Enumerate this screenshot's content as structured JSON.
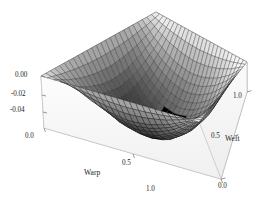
{
  "figure": {
    "kind": "surface-plot-3d",
    "background": "#ffffff",
    "frame_color": "#8a8a8a",
    "mesh_color": "#1a1a1a",
    "skirt_color": "#f2f2f2"
  },
  "axes": {
    "x": {
      "title": "Warp",
      "tick_labels": [
        "0.0",
        "0.5",
        "1.0"
      ],
      "tick_values": [
        0.0,
        0.5,
        1.0
      ],
      "range": [
        0.0,
        1.0
      ]
    },
    "y": {
      "title": "Weft",
      "tick_labels": [
        "0.0",
        "0.5",
        "1.0"
      ],
      "tick_values": [
        0.0,
        0.5,
        1.0
      ],
      "range": [
        0.0,
        1.0
      ]
    },
    "z": {
      "title": "",
      "tick_labels": [
        "0.00",
        "-0.02",
        "-0.04"
      ],
      "tick_values": [
        0.0,
        -0.02,
        -0.04
      ],
      "range": [
        -0.048,
        0.002
      ]
    }
  },
  "chart_data": {
    "type": "surface",
    "title": "",
    "xlabel": "Warp",
    "ylabel": "Weft",
    "zlabel": "",
    "xlim": [
      0.0,
      1.0
    ],
    "ylim": [
      0.0,
      1.0
    ],
    "zlim": [
      -0.048,
      0.002
    ],
    "grid": true,
    "legend": false,
    "colormap": "grayscale",
    "mesh": {
      "rows": 25,
      "cols": 25,
      "visible": true
    },
    "x": [
      0.0,
      0.125,
      0.25,
      0.375,
      0.5,
      0.625,
      0.75,
      0.875,
      1.0
    ],
    "y": [
      0.0,
      0.125,
      0.25,
      0.375,
      0.5,
      0.625,
      0.75,
      0.875,
      1.0
    ],
    "z": [
      [
        0.0,
        0.0,
        0.0,
        0.0,
        0.0,
        0.0,
        0.0,
        0.0,
        0.0
      ],
      [
        0.0,
        -0.011,
        -0.019,
        -0.024,
        -0.026,
        -0.024,
        -0.019,
        -0.011,
        0.0
      ],
      [
        0.0,
        -0.019,
        -0.032,
        -0.04,
        -0.043,
        -0.04,
        -0.032,
        -0.019,
        0.0
      ],
      [
        0.0,
        -0.024,
        -0.04,
        -0.05,
        -0.053,
        -0.05,
        -0.04,
        -0.024,
        0.0
      ],
      [
        0.0,
        -0.026,
        -0.043,
        -0.053,
        -0.056,
        -0.053,
        -0.043,
        -0.026,
        0.0
      ],
      [
        0.0,
        -0.024,
        -0.04,
        -0.05,
        -0.053,
        -0.05,
        -0.04,
        -0.024,
        0.0
      ],
      [
        0.0,
        -0.019,
        -0.032,
        -0.04,
        -0.043,
        -0.04,
        -0.032,
        -0.019,
        0.0
      ],
      [
        0.0,
        -0.011,
        -0.019,
        -0.024,
        -0.026,
        -0.024,
        -0.019,
        -0.011,
        0.0
      ],
      [
        0.0,
        0.0,
        0.0,
        0.0,
        0.0,
        0.0,
        0.0,
        0.0,
        0.0
      ]
    ],
    "z_min": -0.045,
    "z_max": 0.0
  }
}
